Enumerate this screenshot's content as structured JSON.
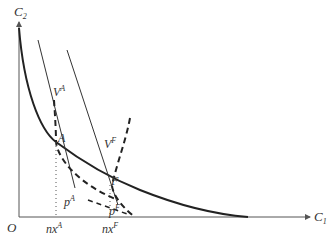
{
  "diagram": {
    "axes": {
      "y_label": "C",
      "y_label_sub": "2",
      "x_label": "C",
      "x_label_sub": "1",
      "origin_label": "O"
    },
    "points": {
      "A": "A",
      "F": "F"
    },
    "curves": {
      "V_A": {
        "base": "V",
        "sup": "A"
      },
      "V_F": {
        "base": "V",
        "sup": "F"
      },
      "p_A": {
        "base": "p",
        "sup": "A"
      },
      "p_F": {
        "base": "p",
        "sup": "F"
      }
    },
    "ticks": {
      "nx_A": {
        "base": "nx",
        "sup": "A"
      },
      "nx_F": {
        "base": "nx",
        "sup": "F"
      }
    },
    "colors": {
      "line": "#222222",
      "axis": "#555555",
      "text": "#333333"
    }
  }
}
